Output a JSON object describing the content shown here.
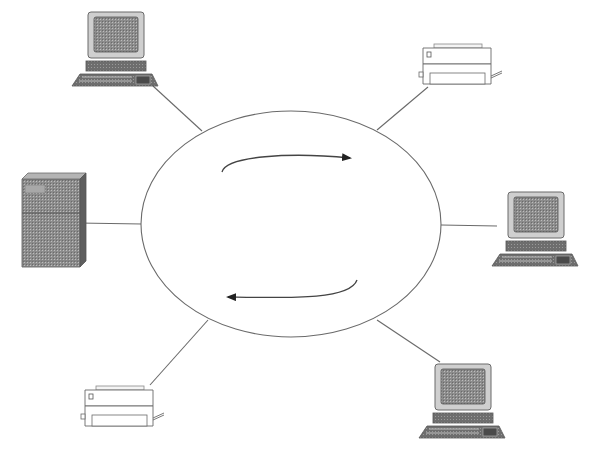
{
  "diagram": {
    "type": "ring-network-topology",
    "ring": {
      "label": "ring",
      "center": [
        291,
        224
      ],
      "rx": 150,
      "ry": 113,
      "stroke": "#6a6a6a"
    },
    "flow_arrows": [
      {
        "name": "clockwise-arrow-top",
        "direction": "right",
        "path": "M222,172 C226,156 290,152 350,158"
      },
      {
        "name": "clockwise-arrow-bottom",
        "direction": "left",
        "path": "M357,280 C350,300 290,298 228,297"
      }
    ],
    "nodes": [
      {
        "id": "pc-top-left",
        "kind": "workstation",
        "x": 70,
        "y": 10,
        "link_from": [
          202,
          131
        ],
        "link_to": [
          153,
          86
        ]
      },
      {
        "id": "printer-top-right",
        "kind": "printer",
        "x": 418,
        "y": 40,
        "link_from": [
          377,
          130
        ],
        "link_to": [
          428,
          87
        ]
      },
      {
        "id": "server-left",
        "kind": "server",
        "x": 18,
        "y": 175,
        "link_from": [
          142,
          224
        ],
        "link_to": [
          78,
          223
        ]
      },
      {
        "id": "pc-right",
        "kind": "workstation",
        "x": 490,
        "y": 190,
        "link_from": [
          441,
          225
        ],
        "link_to": [
          497,
          226
        ]
      },
      {
        "id": "printer-bottom-left",
        "kind": "printer",
        "x": 80,
        "y": 382,
        "link_from": [
          208,
          320
        ],
        "link_to": [
          150,
          385
        ]
      },
      {
        "id": "pc-bottom-right",
        "kind": "workstation",
        "x": 417,
        "y": 362,
        "link_from": [
          377,
          320
        ],
        "link_to": [
          440,
          362
        ]
      }
    ],
    "colors": {
      "line": "#6a6a6a",
      "device_dark": "#6e6e6e",
      "device_mid": "#9a9a9a",
      "device_light": "#d2d2d2",
      "screen": "#8a8a8a",
      "outline": "#555555"
    }
  }
}
